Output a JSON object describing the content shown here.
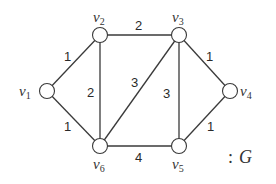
{
  "graph": {
    "name": "G",
    "caption": ": G",
    "caption_colon": ":",
    "caption_letter": "G",
    "nodes": [
      {
        "id": "v1",
        "label": "v",
        "sub": "1",
        "x": 47,
        "y": 91
      },
      {
        "id": "v2",
        "label": "v",
        "sub": "2",
        "x": 100,
        "y": 35
      },
      {
        "id": "v3",
        "label": "v",
        "sub": "3",
        "x": 179,
        "y": 35
      },
      {
        "id": "v4",
        "label": "v",
        "sub": "4",
        "x": 230,
        "y": 91
      },
      {
        "id": "v5",
        "label": "v",
        "sub": "5",
        "x": 179,
        "y": 146
      },
      {
        "id": "v6",
        "label": "v",
        "sub": "6",
        "x": 100,
        "y": 146
      }
    ],
    "edges": [
      {
        "from": "v1",
        "to": "v2",
        "weight": "1"
      },
      {
        "from": "v1",
        "to": "v6",
        "weight": "1"
      },
      {
        "from": "v2",
        "to": "v3",
        "weight": "2"
      },
      {
        "from": "v2",
        "to": "v6",
        "weight": "2"
      },
      {
        "from": "v3",
        "to": "v6",
        "weight": "3"
      },
      {
        "from": "v3",
        "to": "v5",
        "weight": "3"
      },
      {
        "from": "v3",
        "to": "v4",
        "weight": "1"
      },
      {
        "from": "v4",
        "to": "v5",
        "weight": "1"
      },
      {
        "from": "v6",
        "to": "v5",
        "weight": "4"
      }
    ]
  }
}
